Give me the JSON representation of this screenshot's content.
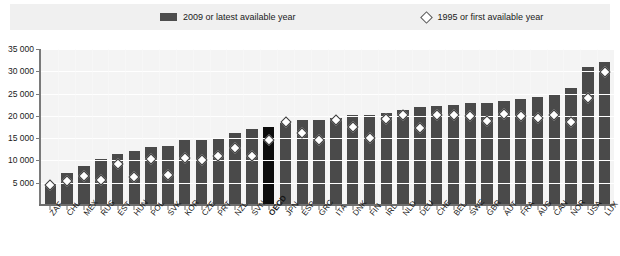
{
  "legend": {
    "series": [
      {
        "label": "2009 or latest available year",
        "marker": "bar-swatch",
        "color": "#4d4d4d"
      },
      {
        "label": "1995 or first available year",
        "marker": "diamond-marker",
        "color": "#ffffff"
      }
    ]
  },
  "chart_data": {
    "type": "bar",
    "title": "",
    "subtitle": "",
    "xlabel": "",
    "ylabel": "",
    "ylim": [
      0,
      35000
    ],
    "yticks": [
      0,
      5000,
      10000,
      15000,
      20000,
      25000,
      30000,
      35000
    ],
    "ytick_labels": [
      "0",
      "5 000",
      "10 000",
      "15 000",
      "20 000",
      "25 000",
      "30 000",
      "35 000"
    ],
    "grid": true,
    "legend_position": "top",
    "highlight_category": "OECD",
    "highlight_color": "#0d0d0d",
    "bar_color": "#4a4a4a",
    "categories": [
      "ZAF",
      "CHL",
      "MEX",
      "RUS",
      "EST",
      "HUN",
      "POL",
      "SVK",
      "KOR",
      "CZE",
      "PRT",
      "NZL",
      "SVN",
      "OECD",
      "JPN",
      "ESP",
      "GRC",
      "ITA",
      "DNK",
      "FIN",
      "IRL",
      "NLD",
      "DEU",
      "CHE",
      "BEL",
      "SWE",
      "GBR",
      "AUT",
      "FRA",
      "AUS",
      "CAN",
      "NOR",
      "USA",
      "LUX"
    ],
    "series": [
      {
        "name": "2009 or latest available year",
        "values": [
          5000,
          7200,
          8700,
          10300,
          11500,
          12200,
          13000,
          13200,
          14500,
          14500,
          15100,
          16100,
          17100,
          17600,
          18300,
          19000,
          19100,
          19600,
          20200,
          20300,
          20700,
          21300,
          22000,
          22300,
          22500,
          22900,
          23000,
          23300,
          23800,
          24200,
          24600,
          26300,
          31000,
          32100
        ]
      },
      {
        "name": "1995 or first available year",
        "values": [
          4600,
          5300,
          6400,
          5600,
          9300,
          6200,
          10300,
          6700,
          10500,
          10200,
          11000,
          12700,
          11000,
          14500,
          18700,
          16200,
          14500,
          19000,
          17400,
          15100,
          19400,
          20100,
          17300,
          20300,
          20300,
          20000,
          18900,
          20400,
          19900,
          19500,
          20100,
          18600,
          24000,
          29800
        ]
      }
    ]
  }
}
